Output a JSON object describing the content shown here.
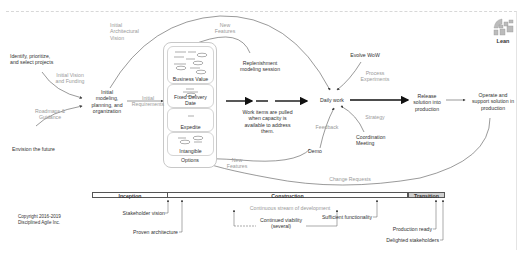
{
  "logo": {
    "label": "Lean",
    "icon": "lean-lifecycle-icon"
  },
  "nodes": {
    "identify": "Identify, prioritize,\nand select projects",
    "envision": "Envision the future",
    "initial_modeling": "Initial\nmodeling,\nplanning, and\norganization",
    "replenishment": "Replenishment\nmodeling session",
    "work_items": "Work items are pulled\nwhen capacity is\navailable to address\nthem.",
    "daily_work": "Daily work",
    "evolve_wow": "Evolve WoW",
    "coordination": "Coordination\nMeeting",
    "demo": "Demo",
    "release": "Release\nsolution into\nproduction",
    "operate": "Operate and\nsupport solution in\nproduction"
  },
  "edge_labels": {
    "initial_architectural_vision": "Initial\nArchitectural\nVision",
    "initial_vision_funding": "Initial Vision\nand Funding",
    "roadmaps_guidance": "Roadmaps &\nGuidance",
    "initial_requirements": "Initial\nRequirements",
    "new_features_top": "New\nFeatures",
    "new_features_bottom": "New\nFeatures",
    "process_experiments": "Process\nExperiments",
    "strategy": "Strategy",
    "feedback": "Feedback",
    "change_requests": "Change Requests"
  },
  "options_pool": {
    "sections": [
      "Business Value",
      "Fixed Delivery Date",
      "Expedite",
      "Intangible"
    ],
    "footer": "Options"
  },
  "phases": [
    {
      "label": "Inception"
    },
    {
      "label": "Construction"
    },
    {
      "label": "Transition"
    }
  ],
  "milestones": {
    "stakeholder_vision": "Stakeholder vision",
    "proven_architecture": "Proven architecture",
    "continuous_stream": "Continuous stream of development",
    "continued_viability": "Continued viability\n(several)",
    "sufficient_functionality": "Sufficient functionality",
    "production_ready": "Production ready",
    "delighted_stakeholders": "Delighted stakeholders"
  },
  "copyright": "Copyright 2016-2019\nDisciplined Agile Inc."
}
